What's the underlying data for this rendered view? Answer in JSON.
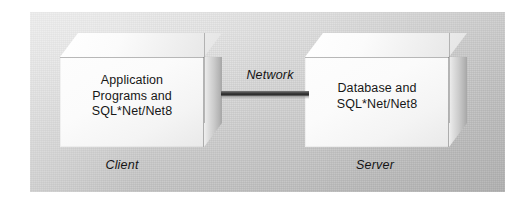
{
  "figure": {
    "type": "block-diagram",
    "background_color": "#ffffff",
    "panel_color": "#d0d0d0"
  },
  "nodes": [
    {
      "id": "client",
      "shape": "3d-box",
      "body_text": "Application\nPrograms and\nSQL*Net/Net8",
      "caption": "Client",
      "position": "left"
    },
    {
      "id": "server",
      "shape": "3d-box",
      "body_text": "Database and\nSQL*Net/Net8",
      "caption": "Server",
      "position": "right"
    }
  ],
  "connector": {
    "label": "Network",
    "style": "solid-thick-line",
    "from": "client",
    "to": "server",
    "color": "#333333"
  }
}
